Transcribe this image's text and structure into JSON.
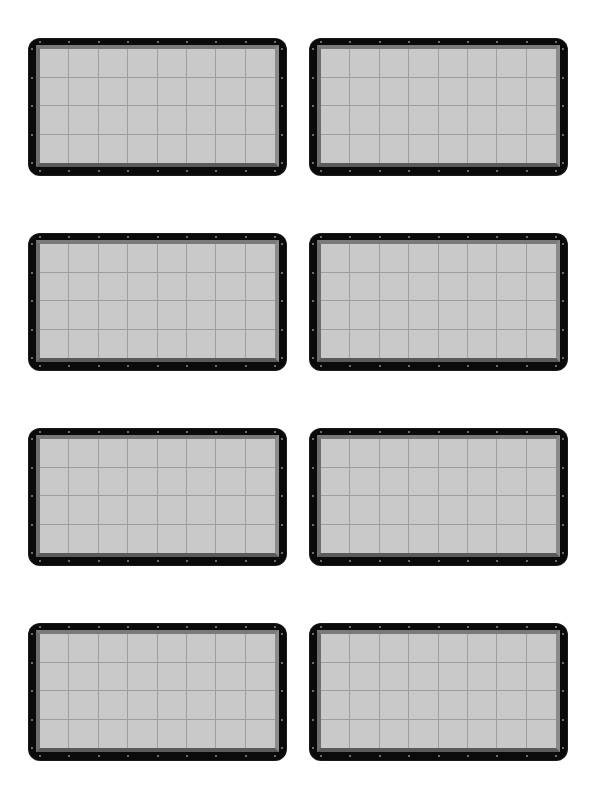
{
  "page": {
    "background": "#ffffff",
    "layout": {
      "rows": 4,
      "columns": 2
    }
  },
  "panel_style": {
    "frame_color": "#0a0a0a",
    "bevel_color": "#7a7a7a",
    "fill_color": "#c9c9c9",
    "grid_line_color": "#9e9e9e",
    "screw_color": "#8c8c8c",
    "grid": {
      "columns": 8,
      "rows": 4
    }
  },
  "panels": [
    {
      "id": "panel-1",
      "row": 1,
      "col": 1
    },
    {
      "id": "panel-2",
      "row": 1,
      "col": 2
    },
    {
      "id": "panel-3",
      "row": 2,
      "col": 1
    },
    {
      "id": "panel-4",
      "row": 2,
      "col": 2
    },
    {
      "id": "panel-5",
      "row": 3,
      "col": 1
    },
    {
      "id": "panel-6",
      "row": 3,
      "col": 2
    },
    {
      "id": "panel-7",
      "row": 4,
      "col": 1
    },
    {
      "id": "panel-8",
      "row": 4,
      "col": 2
    }
  ]
}
